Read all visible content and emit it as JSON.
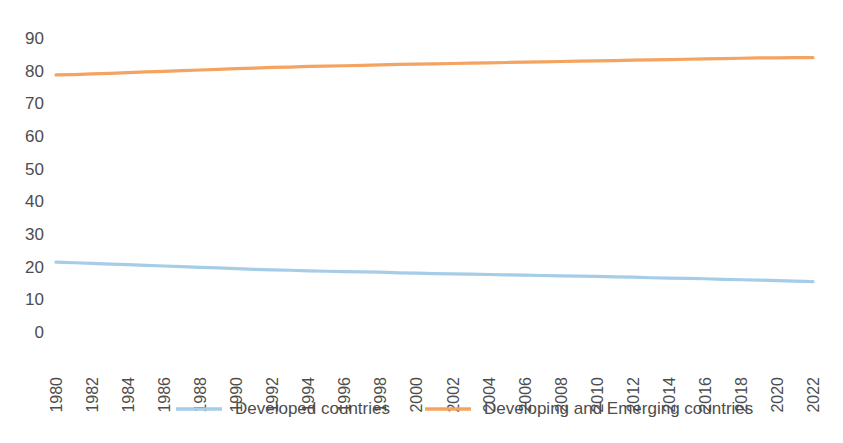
{
  "chart_data": {
    "type": "line",
    "title": "",
    "subtitle": "",
    "xlabel": "",
    "ylabel": "",
    "xlim": [
      1980,
      2022
    ],
    "ylim": [
      0,
      90
    ],
    "ytick_step": 10,
    "xtick_step": 2,
    "grid": false,
    "legend_position": "bottom",
    "yticks": [
      "0",
      "10",
      "20",
      "30",
      "40",
      "50",
      "60",
      "70",
      "80",
      "90"
    ],
    "x": [
      1980,
      1981,
      1982,
      1983,
      1984,
      1985,
      1986,
      1987,
      1988,
      1989,
      1990,
      1991,
      1992,
      1993,
      1994,
      1995,
      1996,
      1997,
      1998,
      1999,
      2000,
      2001,
      2002,
      2003,
      2004,
      2005,
      2006,
      2007,
      2008,
      2009,
      2010,
      2011,
      2012,
      2013,
      2014,
      2015,
      2016,
      2017,
      2018,
      2019,
      2020,
      2021,
      2022
    ],
    "xticks": [
      "1980",
      "1982",
      "1984",
      "1986",
      "1988",
      "1990",
      "1992",
      "1994",
      "1996",
      "1998",
      "2000",
      "2002",
      "2004",
      "2006",
      "2008",
      "2010",
      "2012",
      "2014",
      "2016",
      "2018",
      "2020",
      "2022"
    ],
    "series": [
      {
        "name": "Developed countries",
        "color": "#A5CDE8",
        "values": [
          21.4,
          21.2,
          21.0,
          20.8,
          20.6,
          20.4,
          20.2,
          20.0,
          19.8,
          19.6,
          19.4,
          19.2,
          19.0,
          18.9,
          18.7,
          18.6,
          18.5,
          18.4,
          18.3,
          18.1,
          18.0,
          17.9,
          17.8,
          17.7,
          17.6,
          17.5,
          17.4,
          17.3,
          17.2,
          17.1,
          17.0,
          16.9,
          16.8,
          16.6,
          16.5,
          16.4,
          16.3,
          16.1,
          16.0,
          15.9,
          15.7,
          15.6,
          15.4
        ]
      },
      {
        "name": "Developing and Emerging countries",
        "color": "#F4A460",
        "values": [
          78.7,
          78.8,
          79.0,
          79.2,
          79.4,
          79.6,
          79.8,
          80.0,
          80.2,
          80.4,
          80.6,
          80.8,
          81.0,
          81.1,
          81.3,
          81.4,
          81.5,
          81.6,
          81.8,
          81.9,
          82.0,
          82.1,
          82.2,
          82.3,
          82.4,
          82.5,
          82.6,
          82.7,
          82.8,
          82.9,
          83.0,
          83.1,
          83.2,
          83.3,
          83.4,
          83.5,
          83.6,
          83.7,
          83.8,
          83.9,
          83.9,
          84.0,
          84.0
        ]
      }
    ]
  }
}
